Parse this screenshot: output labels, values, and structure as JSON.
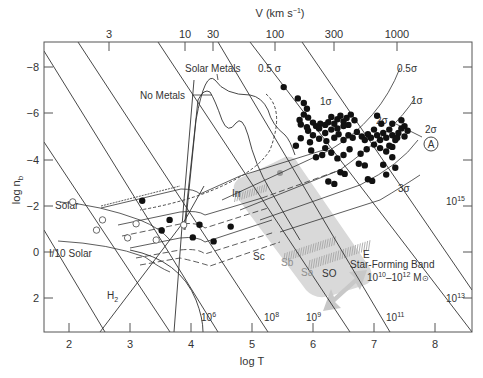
{
  "chart_data": {
    "type": "scatter",
    "title": "",
    "xlabel": "log T",
    "ylabel": "log n_b",
    "top_axis_label": "V (km s⁻¹)",
    "xlim": [
      1.59,
      8.6
    ],
    "ylim": [
      3.46,
      -9.1
    ],
    "y_inverted": true,
    "x_ticks": [
      2,
      3,
      4,
      5,
      6,
      7,
      8
    ],
    "y_ticks": [
      -8,
      -6,
      -4,
      -2,
      0,
      2
    ],
    "y_tick_labels": [
      "−8",
      "−6",
      "−4",
      "−2",
      "0",
      "2"
    ],
    "top_ticks": [
      {
        "label": "3",
        "logT": 2.66
      },
      {
        "label": "10",
        "logT": 3.9
      },
      {
        "label": "30",
        "logT": 4.36
      },
      {
        "label": "100",
        "logT": 5.38
      },
      {
        "label": "300",
        "logT": 6.34
      },
      {
        "label": "1000",
        "logT": 7.38
      }
    ],
    "grid": false,
    "mass_lines": [
      {
        "label": "10⁶",
        "text": "10",
        "exp": "6"
      },
      {
        "label": "10⁸",
        "text": "10",
        "exp": "8"
      },
      {
        "label": "10⁹",
        "text": "10",
        "exp": "9"
      },
      {
        "label": "10¹¹",
        "text": "10",
        "exp": "11"
      },
      {
        "label": "10¹³",
        "text": "10",
        "exp": "13"
      },
      {
        "label": "10¹⁵",
        "text": "10",
        "exp": "15"
      }
    ],
    "annotations": [
      "Solar Metals",
      "No Metals",
      "0.5 σ",
      "0.5σ",
      "1σ",
      "1σ",
      "2σ",
      "2σ",
      "3σ",
      "A",
      "Solar",
      "I/10 Solar",
      "H₂",
      "Irr",
      "Sc",
      "Sb",
      "Sa",
      "SO",
      "E",
      "Star-Forming Band",
      "10¹⁰–10¹² M⊙"
    ],
    "series": [
      {
        "name": "Galaxy groups/clusters (filled)",
        "marker": "filled-circle",
        "points": [
          [
            5.52,
            -7.14
          ],
          [
            5.75,
            -6.65
          ],
          [
            5.85,
            -6.45
          ],
          [
            5.9,
            -6.2
          ],
          [
            5.85,
            -5.95
          ],
          [
            5.78,
            -5.72
          ],
          [
            5.92,
            -5.82
          ],
          [
            5.8,
            -5.52
          ],
          [
            5.9,
            -5.4
          ],
          [
            6.0,
            -5.6
          ],
          [
            6.05,
            -5.45
          ],
          [
            6.12,
            -5.55
          ],
          [
            6.2,
            -5.5
          ],
          [
            6.25,
            -5.62
          ],
          [
            6.3,
            -5.85
          ],
          [
            6.35,
            -5.55
          ],
          [
            6.4,
            -5.75
          ],
          [
            6.45,
            -5.9
          ],
          [
            6.5,
            -5.65
          ],
          [
            6.55,
            -5.8
          ],
          [
            6.58,
            -5.5
          ],
          [
            6.62,
            -5.95
          ],
          [
            6.68,
            -5.7
          ],
          [
            6.5,
            -5.45
          ],
          [
            6.4,
            -5.35
          ],
          [
            6.3,
            -5.3
          ],
          [
            6.2,
            -5.15
          ],
          [
            6.1,
            -5.35
          ],
          [
            6.0,
            -5.05
          ],
          [
            5.92,
            -5.25
          ],
          [
            5.8,
            -4.92
          ],
          [
            5.72,
            -4.6
          ],
          [
            5.95,
            -4.75
          ],
          [
            6.1,
            -4.9
          ],
          [
            6.22,
            -4.8
          ],
          [
            6.35,
            -4.95
          ],
          [
            6.42,
            -5.1
          ],
          [
            6.5,
            -4.85
          ],
          [
            6.58,
            -5.05
          ],
          [
            6.65,
            -4.95
          ],
          [
            6.72,
            -5.2
          ],
          [
            6.8,
            -5.0
          ],
          [
            6.85,
            -4.85
          ],
          [
            6.9,
            -5.1
          ],
          [
            6.95,
            -4.95
          ],
          [
            7.0,
            -5.3
          ],
          [
            7.05,
            -5.05
          ],
          [
            7.1,
            -4.85
          ],
          [
            7.15,
            -5.15
          ],
          [
            7.2,
            -4.95
          ],
          [
            7.25,
            -5.3
          ],
          [
            7.3,
            -5.05
          ],
          [
            7.35,
            -4.85
          ],
          [
            7.4,
            -5.15
          ],
          [
            7.45,
            -5.35
          ],
          [
            7.5,
            -5.0
          ],
          [
            7.3,
            -4.55
          ],
          [
            7.2,
            -4.35
          ],
          [
            7.1,
            -4.5
          ],
          [
            7.0,
            -4.65
          ],
          [
            6.88,
            -4.45
          ],
          [
            6.78,
            -4.25
          ],
          [
            6.6,
            -4.45
          ],
          [
            6.5,
            -4.2
          ],
          [
            6.4,
            -4.05
          ],
          [
            6.3,
            -4.3
          ],
          [
            6.2,
            -4.5
          ],
          [
            6.15,
            -4.2
          ],
          [
            5.97,
            -4.4
          ],
          [
            6.05,
            -4.1
          ],
          [
            7.05,
            -5.9
          ],
          [
            7.12,
            -5.55
          ],
          [
            7.3,
            -5.55
          ],
          [
            7.45,
            -5.7
          ],
          [
            7.5,
            -5.45
          ],
          [
            7.55,
            -5.25
          ],
          [
            7.38,
            -4.95
          ],
          [
            7.25,
            -4.6
          ],
          [
            6.75,
            -3.82
          ],
          [
            6.85,
            -3.75
          ],
          [
            7.15,
            -3.78
          ],
          [
            7.3,
            -4.1
          ],
          [
            6.45,
            -3.45
          ],
          [
            6.52,
            -3.38
          ],
          [
            6.9,
            -3.15
          ],
          [
            6.97,
            -3.08
          ],
          [
            7.2,
            -3.35
          ],
          [
            7.35,
            -3.65
          ],
          [
            6.25,
            -3.05
          ],
          [
            6.35,
            -2.95
          ]
        ]
      },
      {
        "name": "Groups low-T (filled)",
        "marker": "filled-circle",
        "points": [
          [
            3.2,
            -2.22
          ],
          [
            3.65,
            -1.39
          ],
          [
            3.52,
            -0.93
          ],
          [
            4.03,
            -0.63
          ],
          [
            4.14,
            -1.18
          ],
          [
            4.37,
            -0.46
          ],
          [
            4.65,
            -1.1
          ]
        ]
      },
      {
        "name": "Open circles",
        "marker": "open-circle",
        "points": [
          [
            2.06,
            -2.17
          ],
          [
            2.55,
            -1.39
          ],
          [
            2.45,
            -0.95
          ],
          [
            2.96,
            -0.61
          ],
          [
            3.1,
            -1.22
          ],
          [
            3.43,
            -0.52
          ],
          [
            3.88,
            -1.17
          ]
        ]
      },
      {
        "name": "Gray point",
        "marker": "gray-circle",
        "points": [
          [
            5.1,
            -3.35
          ]
        ]
      }
    ],
    "cooling_curves": [
      "Solar Metals",
      "No Metals"
    ],
    "shaded_regions": [
      "Hubble-sequence band (Irr, Sc, Sb, Sa, SO, E)",
      "Star-Forming Band arrow"
    ]
  },
  "labels": {
    "top_axis": "V (km s",
    "top_axis_sup": "−1",
    "top_axis_close": ")",
    "yaxis": "log n",
    "yaxis_sub": "b",
    "xaxis": "log T",
    "solar_metals": "Solar Metals",
    "no_metals": "No Metals",
    "half_sigma_left": "0.5 σ",
    "half_sigma_right": "0.5σ",
    "one_sigma_a": "1σ",
    "one_sigma_b": "1σ",
    "two_sigma_a": "2σ",
    "two_sigma_b": "2σ",
    "three_sigma": "3σ",
    "marker_a": "A",
    "solar": "Solar",
    "tenth_solar": "I/10 Solar",
    "h2": "H",
    "h2_sub": "2",
    "irr": "Irr",
    "sc": "Sc",
    "sb": "Sb",
    "sa": "Sa",
    "so": "SO",
    "e": "E",
    "star_forming_band": "Star-Forming Band",
    "sfb_mass_a": "10",
    "sfb_mass_a_sup": "10",
    "sfb_mass_dash": "–10",
    "sfb_mass_b_sup": "12",
    "sfb_mass_unit": " M",
    "sfb_sun": "⊙"
  },
  "colors": {
    "axis": "#555555",
    "line": "#333333",
    "band": "#d6d6d6",
    "arrow": "#cccccc",
    "hatch": "#aaaaaa",
    "point": "#111111"
  }
}
